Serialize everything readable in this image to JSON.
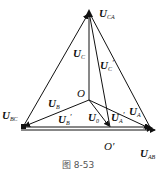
{
  "figure": {
    "caption": "图 8-53",
    "vertices": {
      "C": {
        "x": 89,
        "y": 12
      },
      "B": {
        "x": 23,
        "y": 127
      },
      "A": {
        "x": 151,
        "y": 129
      },
      "O": {
        "x": 89,
        "y": 100
      },
      "O_prime": {
        "x": 110,
        "y": 128
      }
    },
    "labels": {
      "U_CA": {
        "main": "U",
        "sub": "CA"
      },
      "U_BC": {
        "main": "U",
        "sub": "BC"
      },
      "U_AB": {
        "main": "U",
        "sub": "AB"
      },
      "U_C": {
        "main": "U",
        "sub": "C"
      },
      "U_C_prime": {
        "main": "U",
        "sub": "C",
        "prime": "′"
      },
      "U_B": {
        "main": "U",
        "sub": "B"
      },
      "U_B_prime": {
        "main": "U",
        "sub": "B",
        "prime": "′"
      },
      "U_A": {
        "main": "U",
        "sub": "A"
      },
      "U_A_prime": {
        "main": "U",
        "sub": "A",
        "prime": "′"
      },
      "U_0": {
        "main": "U",
        "sub": "0"
      },
      "O": "O",
      "O_prime": "O′"
    },
    "colors": {
      "line": "#111111",
      "background": "#ffffff"
    }
  }
}
